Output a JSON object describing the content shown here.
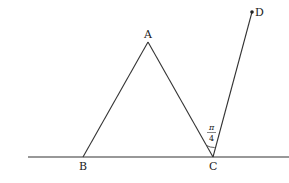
{
  "diagram": {
    "points": {
      "A": {
        "label": "A",
        "x": 148,
        "y": 42
      },
      "B": {
        "label": "B",
        "x": 83,
        "y": 157
      },
      "C": {
        "label": "C",
        "x": 213,
        "y": 157
      },
      "D": {
        "label": "D",
        "x": 252,
        "y": 12
      }
    },
    "baseline": {
      "x1": 28,
      "x2": 289,
      "y": 157
    },
    "angle_label": {
      "numerator": "π",
      "denominator": "4"
    },
    "colors": {
      "stroke": "#333333",
      "background": "#ffffff"
    }
  }
}
